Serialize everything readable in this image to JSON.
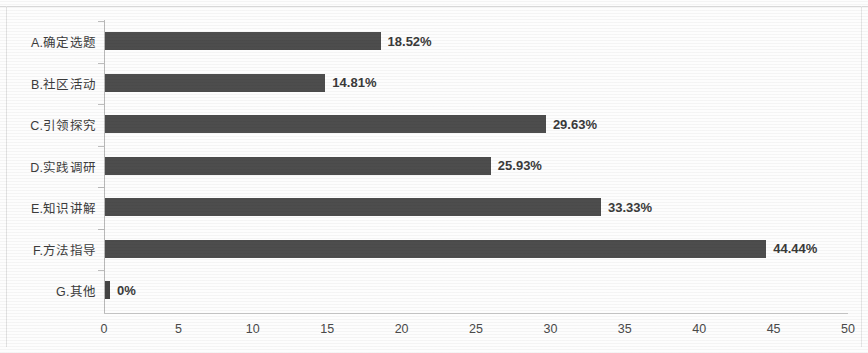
{
  "chart_data": {
    "type": "bar",
    "orientation": "horizontal",
    "title": "",
    "xlabel": "",
    "ylabel": "",
    "xlim": [
      0,
      50
    ],
    "xticks": [
      "0",
      "5",
      "10",
      "15",
      "20",
      "25",
      "30",
      "35",
      "40",
      "45",
      "50"
    ],
    "xtick_values": [
      0,
      5,
      10,
      15,
      20,
      25,
      30,
      35,
      40,
      45,
      50
    ],
    "grid": false,
    "legend": false,
    "bar_color": "#4d4d4d",
    "categories": [
      "A.确定选题",
      "B.社区活动",
      "C.引领探究",
      "D.实践调研",
      "E.知识讲解",
      "F.方法指导",
      "G.其他"
    ],
    "values": [
      18.52,
      14.81,
      29.63,
      25.93,
      33.33,
      44.44,
      0
    ],
    "value_labels": [
      "18.52%",
      "14.81%",
      "29.63%",
      "25.93%",
      "33.33%",
      "44.44%",
      "0%"
    ],
    "series": [
      {
        "name": "",
        "values": [
          18.52,
          14.81,
          29.63,
          25.93,
          33.33,
          44.44,
          0
        ]
      }
    ]
  }
}
